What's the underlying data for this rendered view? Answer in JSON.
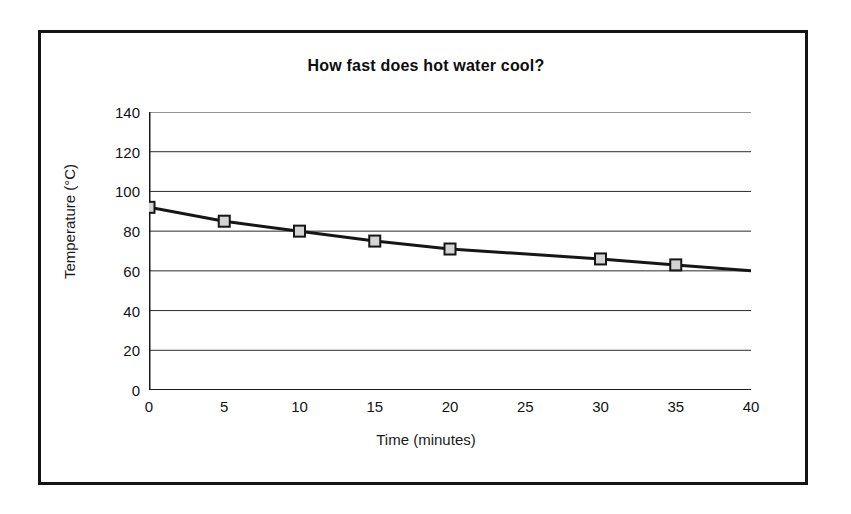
{
  "chart_data": {
    "type": "line",
    "title": "How fast does hot water cool?",
    "xlabel": "Time (minutes)",
    "ylabel": "Temperature (°C)",
    "xlim": [
      0,
      40
    ],
    "ylim": [
      0,
      140
    ],
    "xticks": [
      0,
      5,
      10,
      15,
      20,
      25,
      30,
      35,
      40
    ],
    "yticks": [
      0,
      20,
      40,
      60,
      80,
      100,
      120,
      140
    ],
    "xtick_labels": [
      "0",
      "5",
      "10",
      "15",
      "20",
      "25",
      "30",
      "35",
      "40"
    ],
    "ytick_labels": [
      "0",
      "20",
      "40",
      "60",
      "80",
      "100",
      "120",
      "140"
    ],
    "grid": "horizontal",
    "legend": "none",
    "series": [
      {
        "name": "Water temperature",
        "marker": "square",
        "marker_fill": "#d4d4d4",
        "marker_stroke": "#161616",
        "line_color": "#161616",
        "line_width": 3,
        "x": [
          0,
          5,
          10,
          15,
          20,
          30,
          35,
          40
        ],
        "y": [
          92,
          85,
          80,
          75,
          71,
          66,
          63,
          60
        ],
        "points": [
          {
            "x": 0,
            "y": 92,
            "marker": true
          },
          {
            "x": 5,
            "y": 85,
            "marker": true
          },
          {
            "x": 10,
            "y": 80,
            "marker": true
          },
          {
            "x": 15,
            "y": 75,
            "marker": true
          },
          {
            "x": 20,
            "y": 71,
            "marker": true
          },
          {
            "x": 30,
            "y": 66,
            "marker": true
          },
          {
            "x": 35,
            "y": 63,
            "marker": true
          },
          {
            "x": 40,
            "y": 60,
            "marker": false
          }
        ]
      }
    ]
  },
  "colors": {
    "frame": "#141414",
    "axis": "#1a1a1a",
    "gridline": "#2b2b2b",
    "line": "#161616",
    "marker_fill": "#d4d4d4",
    "background": "#ffffff"
  }
}
